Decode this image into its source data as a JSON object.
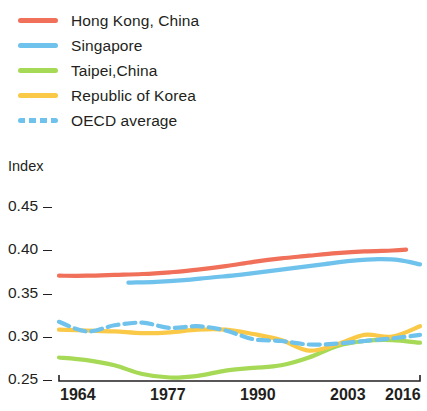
{
  "legend": {
    "items": [
      {
        "label": "Hong Kong, China",
        "color": "#f0705a",
        "style": "solid",
        "icon": "line-swatch-icon"
      },
      {
        "label": "Singapore",
        "color": "#6ec2ec",
        "style": "solid",
        "icon": "line-swatch-icon"
      },
      {
        "label": "Taipei,China",
        "color": "#a6d955",
        "style": "solid",
        "icon": "line-swatch-icon"
      },
      {
        "label": "Republic of Korea",
        "color": "#f9c947",
        "style": "solid",
        "icon": "line-swatch-icon"
      },
      {
        "label": "OECD average",
        "color": "#6ec2ec",
        "style": "dashed",
        "icon": "dashed-line-swatch-icon"
      }
    ]
  },
  "axes": {
    "y_title": "Index",
    "y_ticks": [
      "0.45",
      "0.40",
      "0.35",
      "0.30",
      "0.25"
    ],
    "x_ticks": [
      "1964",
      "1977",
      "1990",
      "2003",
      "2016"
    ]
  },
  "chart_data": {
    "type": "line",
    "title": "",
    "xlabel": "",
    "ylabel": "Index",
    "xlim": [
      1964,
      2016
    ],
    "ylim": [
      0.25,
      0.45
    ],
    "y_ticks": [
      0.25,
      0.3,
      0.35,
      0.4,
      0.45
    ],
    "x_ticks": [
      1964,
      1977,
      1990,
      2003,
      2016
    ],
    "grid": false,
    "legend_position": "above-plot-left",
    "series": [
      {
        "name": "Hong Kong, China",
        "color": "#f0705a",
        "style": "solid",
        "x": [
          1964,
          1968,
          1972,
          1976,
          1980,
          1984,
          1988,
          1992,
          1996,
          2000,
          2004,
          2008,
          2012,
          2014
        ],
        "values": [
          0.371,
          0.371,
          0.372,
          0.373,
          0.375,
          0.378,
          0.382,
          0.387,
          0.391,
          0.394,
          0.397,
          0.399,
          0.4,
          0.401
        ]
      },
      {
        "name": "Singapore",
        "color": "#6ec2ec",
        "style": "solid",
        "x": [
          1974,
          1978,
          1982,
          1986,
          1990,
          1994,
          1998,
          2002,
          2006,
          2010,
          2013,
          2016
        ],
        "values": [
          0.363,
          0.364,
          0.366,
          0.369,
          0.372,
          0.376,
          0.38,
          0.384,
          0.388,
          0.39,
          0.389,
          0.384
        ]
      },
      {
        "name": "Taipei,China",
        "color": "#a6d955",
        "style": "solid",
        "x": [
          1964,
          1968,
          1972,
          1976,
          1980,
          1984,
          1988,
          1992,
          1996,
          2000,
          2004,
          2008,
          2012,
          2016
        ],
        "values": [
          0.277,
          0.274,
          0.268,
          0.258,
          0.254,
          0.256,
          0.262,
          0.265,
          0.268,
          0.277,
          0.29,
          0.296,
          0.297,
          0.294
        ]
      },
      {
        "name": "Republic of Korea",
        "color": "#f9c947",
        "style": "solid",
        "x": [
          1964,
          1968,
          1972,
          1976,
          1980,
          1984,
          1988,
          1992,
          1996,
          2000,
          2004,
          2008,
          2012,
          2016
        ],
        "values": [
          0.309,
          0.308,
          0.307,
          0.305,
          0.306,
          0.309,
          0.309,
          0.304,
          0.297,
          0.285,
          0.292,
          0.303,
          0.301,
          0.313
        ]
      },
      {
        "name": "OECD average",
        "color": "#6ec2ec",
        "style": "dashed",
        "x": [
          1964,
          1968,
          1972,
          1976,
          1980,
          1984,
          1988,
          1992,
          1996,
          2000,
          2004,
          2008,
          2012,
          2016
        ],
        "values": [
          0.318,
          0.307,
          0.314,
          0.317,
          0.311,
          0.313,
          0.308,
          0.298,
          0.296,
          0.292,
          0.293,
          0.296,
          0.299,
          0.303
        ]
      }
    ]
  }
}
